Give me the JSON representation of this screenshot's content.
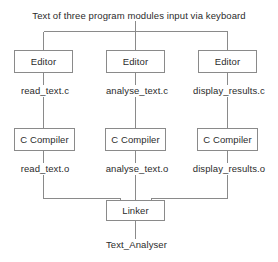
{
  "diagram": {
    "title": "Text of three program modules input via keyboard",
    "colors": {
      "background": "#ffffff",
      "line": "#8a8a8a",
      "box_border": "#8a8a8a",
      "text": "#2b2b2b"
    },
    "editor_nodes": [
      {
        "label": "Editor"
      },
      {
        "label": "Editor"
      },
      {
        "label": "Editor"
      }
    ],
    "source_files": [
      {
        "label": "read_text.c"
      },
      {
        "label": "analyse_text.c"
      },
      {
        "label": "display_results.c"
      }
    ],
    "compiler_nodes": [
      {
        "label": "C Compiler"
      },
      {
        "label": "C Compiler"
      },
      {
        "label": "C Compiler"
      }
    ],
    "object_files": [
      {
        "label": "read_text.o"
      },
      {
        "label": "analyse_text.o"
      },
      {
        "label": "display_results.o"
      }
    ],
    "linker": {
      "label": "Linker"
    },
    "executable": {
      "label": "Text_Analyser"
    }
  }
}
